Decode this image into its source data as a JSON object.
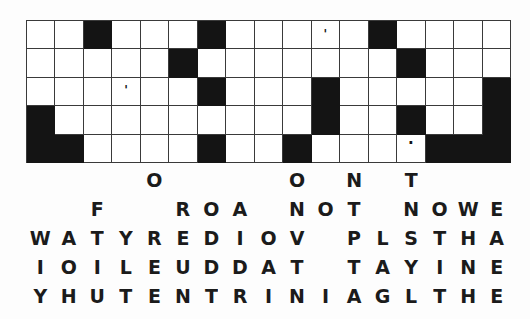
{
  "puzzle": {
    "title": "Crossword-style letter drop puzzle",
    "grid": {
      "columns": 17,
      "rows": 5,
      "block_color": "#141414",
      "open_color": "#ffffff",
      "line_color": "#3a3a3a",
      "legend": {
        "open": ".",
        "blocked": "#"
      },
      "cells": [
        [
          ".",
          ".",
          "#",
          ".",
          ".",
          ".",
          "#",
          ".",
          ".",
          ".",
          ".",
          ".",
          "#",
          ".",
          ".",
          ".",
          "."
        ],
        [
          ".",
          ".",
          ".",
          ".",
          ".",
          "#",
          ".",
          ".",
          ".",
          ".",
          ".",
          ".",
          ".",
          "#",
          ".",
          ".",
          "."
        ],
        [
          ".",
          ".",
          ".",
          ".",
          ".",
          ".",
          "#",
          ".",
          ".",
          ".",
          "#",
          ".",
          ".",
          ".",
          ".",
          ".",
          "#"
        ],
        [
          "#",
          ".",
          ".",
          ".",
          ".",
          ".",
          ".",
          ".",
          ".",
          ".",
          "#",
          ".",
          ".",
          "#",
          ".",
          ".",
          "#"
        ],
        [
          "#",
          "#",
          ".",
          ".",
          ".",
          ".",
          "#",
          ".",
          ".",
          "#",
          ".",
          ".",
          ".",
          ".",
          "#",
          "#",
          "#"
        ]
      ],
      "marks": [
        {
          "row": 1,
          "col": 11,
          "glyph": "'",
          "kind": "apostrophe"
        },
        {
          "row": 3,
          "col": 4,
          "glyph": "'",
          "kind": "apostrophe"
        },
        {
          "row": 5,
          "col": 14,
          "glyph": "·",
          "kind": "dot"
        }
      ]
    },
    "letter_bank": {
      "columns": 17,
      "rows": [
        [
          " ",
          " ",
          " ",
          " ",
          "O",
          " ",
          " ",
          " ",
          " ",
          "O",
          " ",
          "N",
          " ",
          "T",
          " ",
          " ",
          " "
        ],
        [
          " ",
          " ",
          "F",
          " ",
          " ",
          "R",
          "O",
          "A",
          " ",
          "N",
          "O",
          "T",
          " ",
          "N",
          "O",
          " ",
          "W",
          "E",
          "G"
        ],
        [
          "W",
          "A",
          "T",
          "Y",
          "R",
          "E",
          "D",
          "I",
          "O",
          "V",
          " ",
          "P",
          "L",
          "S",
          "T",
          "H",
          "A"
        ],
        [
          "I",
          "O",
          "I",
          "L",
          "E",
          "U",
          "D",
          "D",
          "A",
          "T",
          " ",
          "T",
          "A",
          "Y",
          "I",
          "N",
          "E",
          "N"
        ],
        [
          "Y",
          "H",
          "U",
          "T",
          "E",
          "N",
          "T",
          "R",
          "I",
          "N",
          "I",
          "A",
          "G",
          "L",
          "T",
          "H",
          "E",
          "R"
        ]
      ],
      "rows_fixed": [
        [
          " ",
          " ",
          " ",
          " ",
          "O",
          " ",
          " ",
          " ",
          " ",
          "O",
          " ",
          "N",
          " ",
          "T",
          " ",
          " ",
          " "
        ],
        [
          " ",
          " ",
          "F",
          " ",
          "R",
          "O",
          "A",
          " ",
          "N",
          "O",
          "T",
          " ",
          "N",
          "O",
          " ",
          "W",
          "E"
        ],
        [
          "W",
          "A",
          "T",
          "Y",
          "R",
          "E",
          "D",
          "I",
          "O",
          "V",
          " ",
          "P",
          "L",
          "S",
          "T",
          "H",
          "A"
        ],
        [
          "I",
          "O",
          "I",
          "L",
          "E",
          "U",
          "D",
          "D",
          "A",
          "T",
          " ",
          "T",
          "A",
          "Y",
          "I",
          "N",
          "E"
        ],
        [
          "Y",
          "H",
          "U",
          "T",
          "E",
          "N",
          "T",
          "R",
          "I",
          "N",
          "I",
          "A",
          "G",
          "L",
          "T",
          "H",
          "E"
        ]
      ],
      "row_text": [
        "    O        O  N  T   ",
        "  F   R O A   N O T   N O   W E G",
        "W A T Y R E D I O V   P L S T H A",
        "I O I L E U D D A T   T A Y I N E N",
        "Y H U T E N T R I N I A G L T H E R"
      ],
      "display_rows": [
        [
          "",
          "",
          "",
          "",
          "O",
          "",
          "",
          "",
          "",
          "O",
          "",
          "N",
          "",
          "T",
          "",
          "",
          ""
        ],
        [
          "",
          "",
          "F",
          "",
          "",
          "R",
          "O",
          "A",
          "",
          "N",
          "O",
          "T",
          "",
          "N",
          "O",
          "W",
          "E",
          "G"
        ],
        [
          "W",
          "A",
          "T",
          "Y",
          "R",
          "E",
          "D",
          "I",
          "O",
          "V",
          "",
          "P",
          "L",
          "S",
          "T",
          "H",
          "A"
        ],
        [
          "I",
          "O",
          "I",
          "L",
          "E",
          "U",
          "D",
          "D",
          "A",
          "T",
          "",
          "T",
          "A",
          "Y",
          "I",
          "N",
          "E",
          "N"
        ],
        [
          "Y",
          "H",
          "U",
          "T",
          "E",
          "N",
          "T",
          "R",
          "I",
          "N",
          "I",
          "A",
          "G",
          "L",
          "T",
          "H",
          "E",
          "R"
        ]
      ]
    }
  }
}
